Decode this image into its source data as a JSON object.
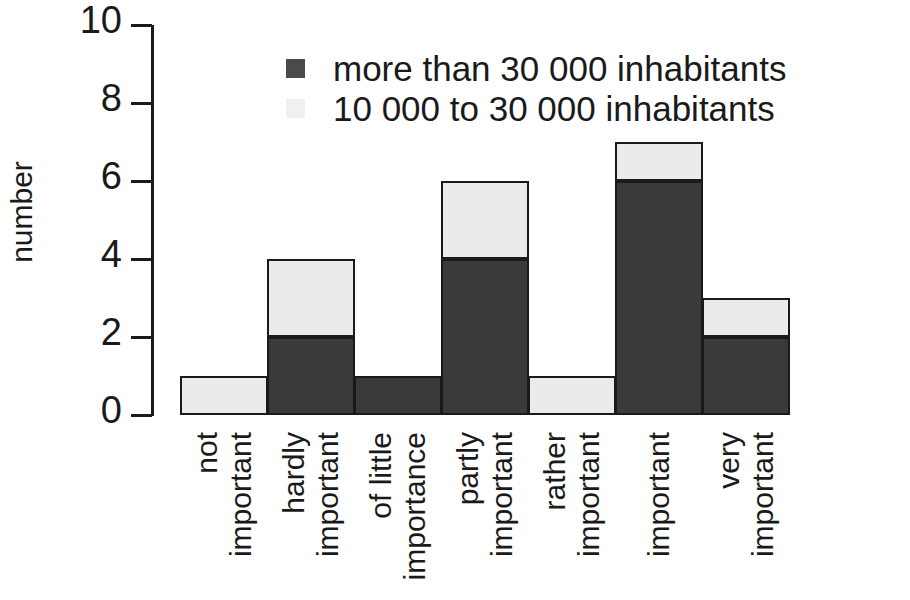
{
  "chart_data": {
    "type": "bar",
    "stacked": true,
    "title": "",
    "xlabel": "",
    "ylabel": "number",
    "ylim": [
      0,
      10
    ],
    "yticks": [
      0,
      2,
      4,
      6,
      8,
      10
    ],
    "grid": false,
    "legend_position": "top-center",
    "categories": [
      "not important",
      "hardly important",
      "of little importance",
      "partly important",
      "rather important",
      "important",
      "very important"
    ],
    "category_lines": [
      [
        "not",
        "important"
      ],
      [
        "hardly",
        "important"
      ],
      [
        "of little",
        "importance"
      ],
      [
        "partly",
        "important"
      ],
      [
        "rather",
        "important"
      ],
      [
        "important"
      ],
      [
        "very",
        "important"
      ]
    ],
    "series": [
      {
        "name": "more than 30 000 inhabitants",
        "color": "#3a3a3a",
        "values": [
          0,
          2,
          1,
          4,
          0,
          6,
          2
        ]
      },
      {
        "name": "10 000 to 30 000 inhabitants",
        "color": "#ebebeb",
        "values": [
          1,
          2,
          0,
          2,
          1,
          1,
          1
        ]
      }
    ],
    "totals": [
      1,
      4,
      1,
      6,
      1,
      7,
      3
    ]
  },
  "legend": {
    "items": [
      {
        "label": "more than 30 000 inhabitants",
        "swatch": "dark"
      },
      {
        "label": "10 000 to 30 000 inhabitants",
        "swatch": "light"
      }
    ]
  },
  "axis": {
    "y_title": "number",
    "y_tick_labels": [
      "0",
      "2",
      "4",
      "6",
      "8",
      "10"
    ]
  }
}
